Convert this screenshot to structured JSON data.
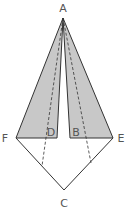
{
  "diagram": {
    "title": "",
    "colors": {
      "fill": "#c8c8c8",
      "stroke": "#333333",
      "label": "#555555",
      "background": "#ffffff"
    },
    "points": {
      "A": {
        "label": "A",
        "x": 63,
        "y": 18
      },
      "F": {
        "label": "F",
        "x": 16,
        "y": 138
      },
      "E": {
        "label": "E",
        "x": 113,
        "y": 138
      },
      "D": {
        "label": "D",
        "x": 57,
        "y": 138
      },
      "B": {
        "label": "B",
        "x": 70,
        "y": 138
      },
      "C": {
        "label": "C",
        "x": 64,
        "y": 190
      }
    },
    "labels": {
      "A": "A",
      "B": "B",
      "C": "C",
      "D": "D",
      "E": "E",
      "F": "F"
    },
    "shaded_regions": [
      {
        "name": "triangle-FAD",
        "vertices": [
          "F",
          "A",
          "D"
        ]
      },
      {
        "name": "triangle-ABE",
        "vertices": [
          "A",
          "B",
          "E"
        ]
      }
    ],
    "solid_segments": [
      [
        "F",
        "C"
      ],
      [
        "C",
        "E"
      ]
    ],
    "dashed_segments": [
      {
        "from": "A",
        "to_xy": [
          42,
          166
        ]
      },
      {
        "from": "A",
        "to_xy": [
          91,
          163
        ]
      }
    ]
  }
}
